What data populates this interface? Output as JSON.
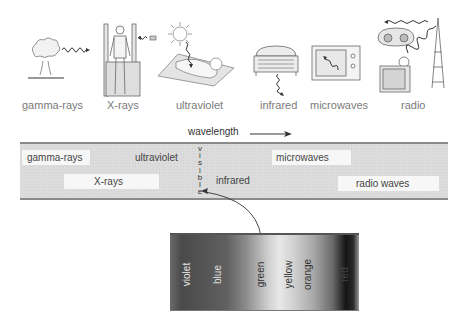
{
  "illustrations": {
    "items": [
      {
        "id": "gamma-rays",
        "label": "gamma-rays",
        "depicts": "nuclear explosion mushroom cloud"
      },
      {
        "id": "x-rays",
        "label": "X-rays",
        "depicts": "person in X-ray scanner"
      },
      {
        "id": "ultraviolet",
        "label": "ultraviolet",
        "depicts": "sun and sunbather on towel"
      },
      {
        "id": "infrared",
        "label": "infrared",
        "depicts": "electric heater"
      },
      {
        "id": "microwaves",
        "label": "microwaves",
        "depicts": "microwave oven"
      },
      {
        "id": "radio",
        "label": "radio",
        "depicts": "radio, television and transmission tower"
      }
    ]
  },
  "spectrum_band": {
    "axis_label": "wavelength",
    "axis_arrow": "→",
    "regions": [
      {
        "label": "gamma-rays",
        "row": 1
      },
      {
        "label": "X-rays",
        "row": 2
      },
      {
        "label": "ultraviolet",
        "row": 1
      },
      {
        "label": "visible",
        "row": "vertical",
        "letters": [
          "v",
          "i",
          "s",
          "i",
          "b",
          "l",
          "e"
        ]
      },
      {
        "label": "infrared",
        "row": 2
      },
      {
        "label": "microwaves",
        "row": 1
      },
      {
        "label": "radio waves",
        "row": 2
      }
    ]
  },
  "visible_spectrum": {
    "colors": [
      "violet",
      "blue",
      "green",
      "yellow",
      "orange",
      "red"
    ]
  }
}
